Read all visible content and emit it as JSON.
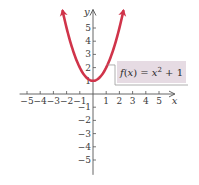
{
  "chart_data": {
    "type": "line",
    "title": "",
    "xlabel": "x",
    "ylabel": "y",
    "xlim": [
      -5.6,
      6.2
    ],
    "ylim": [
      -6.2,
      6.4
    ],
    "grid": false,
    "x_ticks": [
      -5,
      -4,
      -3,
      -2,
      -1,
      1,
      2,
      3,
      4,
      5
    ],
    "x_tick_labels": [
      "−5",
      "−4",
      "−3",
      "−2",
      "−1",
      "1",
      "2",
      "3",
      "4",
      "5"
    ],
    "y_ticks": [
      -5,
      -4,
      -3,
      -2,
      -1,
      1,
      2,
      3,
      4,
      5
    ],
    "y_tick_labels": [
      "−5",
      "−4",
      "−3",
      "−2",
      "−1",
      "1",
      "2",
      "3",
      "4",
      "5"
    ],
    "series": [
      {
        "name": "f(x) = x^2 + 1",
        "function": "x^2 + 1",
        "domain": [
          -2.3,
          2.3
        ],
        "arrows_at_ends": true,
        "color": "#d0344a",
        "x": [
          -2.3,
          -2,
          -1.5,
          -1,
          -0.5,
          0,
          0.5,
          1,
          1.5,
          2,
          2.3
        ],
        "y": [
          6.29,
          5,
          3.25,
          2,
          1.25,
          1,
          1.25,
          2,
          3.25,
          5,
          6.29
        ]
      }
    ],
    "annotation": {
      "text_parts": [
        {
          "text": "f",
          "italic": true
        },
        {
          "text": "(",
          "italic": false
        },
        {
          "text": "x",
          "italic": true
        },
        {
          "text": ") = ",
          "italic": false
        },
        {
          "text": "x",
          "italic": true
        },
        {
          "text": "2",
          "sup": true
        },
        {
          "text": " + 1",
          "italic": false
        }
      ],
      "label": "f(x) = x² + 1",
      "points_to": [
        1.1,
        2.2
      ],
      "box_color": "#e6dbe3"
    },
    "legend": "none"
  },
  "colors": {
    "axis": "#555555",
    "curve": "#d0344a",
    "label_box": "#e6dbe3",
    "label_border": "#9a9a9a"
  }
}
